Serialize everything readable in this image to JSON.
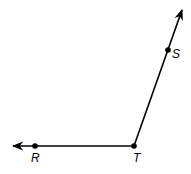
{
  "diagram": {
    "type": "angle",
    "vertex": {
      "label": "T",
      "x": 134,
      "y": 146
    },
    "rays": [
      {
        "name": "ray-TR",
        "through": {
          "label": "R",
          "x": 35,
          "y": 146
        },
        "tip": {
          "x": 12,
          "y": 146
        }
      },
      {
        "name": "ray-TS",
        "through": {
          "label": "S",
          "x": 168,
          "y": 50
        },
        "tip": {
          "x": 183,
          "y": 8
        }
      }
    ],
    "labels": {
      "R": "R",
      "S": "S",
      "T": "T"
    },
    "colors": {
      "stroke": "#000000",
      "background": "#ffffff"
    }
  }
}
